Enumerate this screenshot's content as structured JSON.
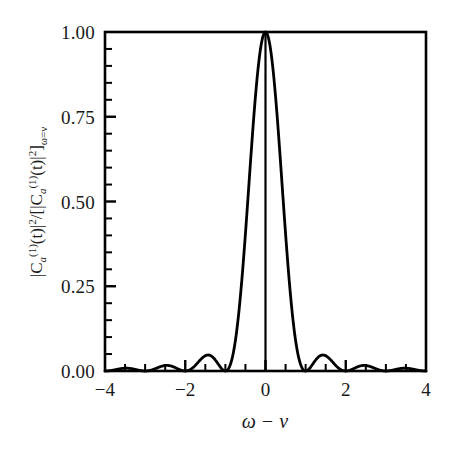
{
  "chart_data": {
    "type": "line",
    "title": "",
    "subtitle": "",
    "xlabel": "ω − ν",
    "ylabel": "|C_a^(1)(t)|² / [|C_a^(1)(t)|²]_{ω=ν}",
    "ylabel_parts": {
      "numerator": "|C",
      "num_sub": "a",
      "num_sup_paren": "(1)",
      "num_t": "(t)|",
      "num_sq": "2",
      "slash": "/[|C",
      "den_sub": "a",
      "den_sup_paren": "(1)",
      "den_t": "(t)|",
      "den_sq": "2",
      "close_bracket": "]",
      "cond_sub": "ω=ν"
    },
    "xlim": [
      -4,
      4
    ],
    "ylim": [
      0,
      1
    ],
    "grid": false,
    "legend": false,
    "xticks": [
      -4,
      -2,
      0,
      2,
      4
    ],
    "xticklabels": [
      "−4",
      "−2",
      "0",
      "2",
      "4"
    ],
    "xminor_step": 0.5,
    "yticks": [
      0,
      0.25,
      0.5,
      0.75,
      1
    ],
    "yticklabels": [
      "0.00",
      "0.25",
      "0.50",
      "0.75",
      "1.00"
    ],
    "yminor_step": 0.05,
    "function": "sinc^2",
    "formula": "sin^2(pi*x)/(pi*x)^2",
    "peak_x": 0,
    "peak_y": 1.0,
    "zeros": [
      -4,
      -3,
      -2,
      -1,
      1,
      2,
      3,
      4
    ],
    "sidelobe_peaks": [
      {
        "x": -3.47,
        "y": 0.008
      },
      {
        "x": -2.46,
        "y": 0.016
      },
      {
        "x": -1.43,
        "y": 0.047
      },
      {
        "x": 1.43,
        "y": 0.047
      },
      {
        "x": 2.46,
        "y": 0.016
      },
      {
        "x": 3.47,
        "y": 0.008
      }
    ],
    "series": [
      {
        "name": "transition probability",
        "x": [
          -4.0,
          -3.9,
          -3.8,
          -3.7,
          -3.6,
          -3.5,
          -3.4,
          -3.3,
          -3.2,
          -3.1,
          -3.0,
          -2.9,
          -2.8,
          -2.7,
          -2.6,
          -2.5,
          -2.4,
          -2.3,
          -2.2,
          -2.1,
          -2.0,
          -1.9,
          -1.8,
          -1.7,
          -1.6,
          -1.5,
          -1.4,
          -1.3,
          -1.2,
          -1.1,
          -1.0,
          -0.9,
          -0.8,
          -0.7,
          -0.6,
          -0.5,
          -0.4,
          -0.3,
          -0.2,
          -0.1,
          0.0,
          0.1,
          0.2,
          0.3,
          0.4,
          0.5,
          0.6,
          0.7,
          0.8,
          0.9,
          1.0,
          1.1,
          1.2,
          1.3,
          1.4,
          1.5,
          1.6,
          1.7,
          1.8,
          1.9,
          2.0,
          2.1,
          2.2,
          2.3,
          2.4,
          2.5,
          2.6,
          2.7,
          2.8,
          2.9,
          3.0,
          3.1,
          3.2,
          3.3,
          3.4,
          3.5,
          3.6,
          3.7,
          3.8,
          3.9,
          4.0
        ],
        "y": [
          0.0,
          0.0025,
          0.0054,
          0.0073,
          0.0079,
          0.0072,
          0.0055,
          0.0034,
          0.0015,
          0.0004,
          0.0,
          0.0005,
          0.002,
          0.0044,
          0.0072,
          0.0101,
          0.0123,
          0.0134,
          0.013,
          0.0109,
          0.0,
          0.0109,
          0.0238,
          0.0374,
          0.0497,
          0.0585,
          0.0621,
          0.0591,
          0.0492,
          0.0332,
          0.0,
          0.0332,
          0.0875,
          0.1624,
          0.2546,
          0.4053,
          0.5728,
          0.7368,
          0.8751,
          0.9675,
          1.0,
          0.9675,
          0.8751,
          0.7368,
          0.5728,
          0.4053,
          0.2546,
          0.1624,
          0.0875,
          0.0332,
          0.0,
          0.0332,
          0.0492,
          0.0591,
          0.0621,
          0.0585,
          0.0497,
          0.0374,
          0.0238,
          0.0109,
          0.0,
          0.0109,
          0.013,
          0.0134,
          0.0123,
          0.0101,
          0.0072,
          0.0044,
          0.002,
          0.0005,
          0.0,
          0.0004,
          0.0015,
          0.0034,
          0.0055,
          0.0072,
          0.0079,
          0.0073,
          0.0054,
          0.0025,
          0.0
        ]
      }
    ],
    "annotations": [
      {
        "name": "center-vertical-line",
        "x": 0,
        "y_from": 0,
        "y_to": 1.0
      }
    ],
    "colors": {
      "curve": "#000000",
      "axis": "#000000",
      "background": "#ffffff",
      "text": "#1a1a1a"
    }
  }
}
